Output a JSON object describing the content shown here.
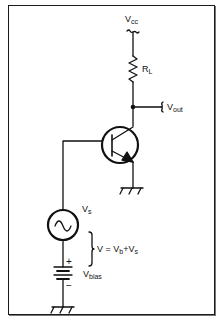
{
  "diagram": {
    "type": "common-emitter amplifier schematic",
    "colors": {
      "line": "#111111",
      "frame": "#1a1a1a",
      "background": "#ffffff"
    },
    "labels": {
      "vcc": {
        "main": "V",
        "sub": "cc"
      },
      "rl": {
        "main": "R",
        "sub": "L"
      },
      "vout": {
        "main": "V",
        "sub": "out"
      },
      "vs": {
        "main": "V",
        "sub": "s"
      },
      "sum": {
        "prefix": "V = V",
        "b": "b",
        "plus": "+V",
        "s": "s"
      },
      "plus_sign": "+",
      "minus_sign": "−",
      "vbias": {
        "main": "V",
        "sub": "bias"
      }
    },
    "components": [
      {
        "id": "supply",
        "name": "Vcc supply terminal"
      },
      {
        "id": "load-resistor",
        "name": "RL"
      },
      {
        "id": "output-node",
        "name": "Vout"
      },
      {
        "id": "transistor",
        "name": "NPN transistor"
      },
      {
        "id": "emitter-ground",
        "name": "ground"
      },
      {
        "id": "signal-source",
        "name": "Vs AC source"
      },
      {
        "id": "bias-battery",
        "name": "Vbias"
      },
      {
        "id": "source-ground",
        "name": "ground"
      }
    ]
  }
}
